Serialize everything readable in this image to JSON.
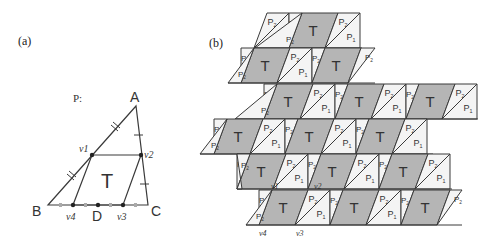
{
  "panels": {
    "a": {
      "label": "(a)",
      "title": "P:",
      "vertices": {
        "A": "A",
        "B": "B",
        "C": "C",
        "D": "D"
      },
      "points": {
        "v1": "v1",
        "v2": "v2",
        "v3": "v3",
        "v4": "v4"
      },
      "center_label": "T"
    },
    "b": {
      "label": "(b)",
      "tile_labels": {
        "T": "T",
        "P1": "P1",
        "P2": "P2"
      },
      "points": {
        "v1": "v1",
        "v2": "v2",
        "v3": "v3",
        "v4": "v4"
      }
    }
  },
  "colors": {
    "line": "#3a3a3a",
    "T_fill": "#b5b5b5",
    "P_fill": "#f4f4f4",
    "text": "#333333"
  },
  "tiling": {
    "row_height": 35,
    "period": 71,
    "rows": [
      {
        "top": 13,
        "t_starts": [
          302
        ],
        "x_min": 255,
        "x_max": 362
      },
      {
        "top": 48,
        "t_starts": [
          254,
          325
        ],
        "x_min": 228,
        "x_max": 375
      },
      {
        "top": 84,
        "t_starts": [
          277,
          348,
          419
        ],
        "x_min": 235,
        "x_max": 478
      },
      {
        "top": 119,
        "t_starts": [
          227,
          298,
          369
        ],
        "x_min": 200,
        "x_max": 433
      },
      {
        "top": 154,
        "t_starts": [
          250,
          321,
          392
        ],
        "x_min": 237,
        "x_max": 452
      },
      {
        "top": 190,
        "t_starts": [
          272,
          343,
          414
        ],
        "x_min": 246,
        "x_max": 462
      }
    ]
  }
}
